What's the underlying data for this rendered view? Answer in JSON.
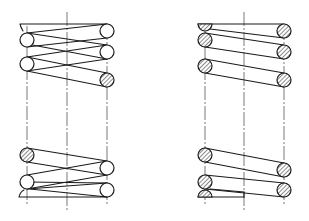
{
  "figure": {
    "colors": {
      "line": "#1a1a1a",
      "centerline": "#555555",
      "background": "#ffffff"
    },
    "views": [
      {
        "id": "left-spring",
        "style": "partial-section",
        "coil_left_x": 27,
        "coil_right_x": 107,
        "axis_x": 67
      },
      {
        "id": "right-spring",
        "style": "full-section-hatched",
        "coil_left_x": 205,
        "coil_right_x": 284,
        "axis_x": 244
      }
    ]
  }
}
